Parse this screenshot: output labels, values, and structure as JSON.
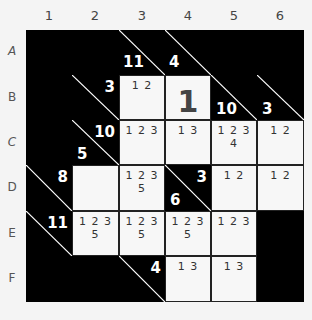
{
  "puzzle": {
    "type": "kakuro",
    "columns": [
      "1",
      "2",
      "3",
      "4",
      "5",
      "6"
    ],
    "rows": [
      "A",
      "B",
      "C",
      "D",
      "E",
      "F"
    ],
    "colors": {
      "block": "#000000",
      "cell": "#f7f7f7",
      "clue_text": "#ffffff",
      "candidate_text": "#333333"
    },
    "cells": [
      [
        {
          "type": "block"
        },
        {
          "type": "block"
        },
        {
          "type": "block",
          "diag": true
        },
        {
          "type": "block",
          "diag": true
        },
        {
          "type": "block"
        },
        {
          "type": "block"
        }
      ],
      [
        {
          "type": "block"
        },
        {
          "type": "block",
          "diag": true,
          "across": "3"
        },
        {
          "type": "white",
          "candidates": "1 2"
        },
        {
          "type": "white",
          "value": "1"
        },
        {
          "type": "block",
          "diag": true,
          "down": "10"
        },
        {
          "type": "block",
          "diag": true,
          "down": "3"
        }
      ],
      [
        {
          "type": "block"
        },
        {
          "type": "block",
          "diag": true,
          "across": "10",
          "down": "5"
        },
        {
          "type": "white",
          "candidates": "1 2 3"
        },
        {
          "type": "white",
          "candidates": "1 3"
        },
        {
          "type": "white",
          "candidates": "1 2 3 4"
        },
        {
          "type": "white",
          "candidates": "1 2"
        }
      ],
      [
        {
          "type": "block",
          "diag": true,
          "across": "8"
        },
        {
          "type": "white",
          "candidates": ""
        },
        {
          "type": "white",
          "candidates": "1 2 3 5"
        },
        {
          "type": "block",
          "diag": true,
          "across": "3",
          "down": "6"
        },
        {
          "type": "white",
          "candidates": "1 2"
        },
        {
          "type": "white",
          "candidates": "1 2"
        }
      ],
      [
        {
          "type": "block",
          "diag": true,
          "across": "11"
        },
        {
          "type": "white",
          "candidates": "1 2 3 5"
        },
        {
          "type": "white",
          "candidates": "1 2 3 5"
        },
        {
          "type": "white",
          "candidates": "1 2 3 5"
        },
        {
          "type": "white",
          "candidates": "1 2 3"
        },
        {
          "type": "block"
        }
      ],
      [
        {
          "type": "block"
        },
        {
          "type": "block"
        },
        {
          "type": "block",
          "diag": true,
          "across": "4"
        },
        {
          "type": "white",
          "candidates": "1 3"
        },
        {
          "type": "white",
          "candidates": "1 3"
        },
        {
          "type": "block"
        }
      ]
    ],
    "top_clues": [
      {
        "col": 3,
        "down": "11",
        "row": "A"
      },
      {
        "col": 4,
        "down": "4",
        "row": "A"
      }
    ]
  }
}
